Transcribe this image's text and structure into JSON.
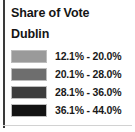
{
  "legend": {
    "title": "Share of Vote",
    "subtitle": "Dublin",
    "classes": [
      {
        "label": "12.1% - 20.0%",
        "color": "#9a9a9a",
        "min": 12.1,
        "max": 20.0
      },
      {
        "label": "20.1% - 28.0%",
        "color": "#6e6e6e",
        "min": 20.1,
        "max": 28.0
      },
      {
        "label": "28.1% - 36.0%",
        "color": "#3d3d3d",
        "min": 28.1,
        "max": 36.0
      },
      {
        "label": "36.1% - 44.0%",
        "color": "#141414",
        "min": 36.1,
        "max": 44.0
      }
    ]
  },
  "chart_data": {
    "type": "table",
    "title": "Share of Vote",
    "subtitle": "Dublin",
    "xlabel": "",
    "ylabel": "",
    "categories": [
      "12.1% - 20.0%",
      "20.1% - 28.0%",
      "28.1% - 36.0%",
      "36.1% - 44.0%"
    ],
    "values": [
      [
        12.1,
        20.0
      ],
      [
        20.1,
        28.0
      ],
      [
        28.1,
        36.0
      ],
      [
        36.1,
        44.0
      ]
    ],
    "series": [
      {
        "name": "Share of Vote class breaks",
        "values": [
          {
            "label": "12.1% - 20.0%",
            "low": 12.1,
            "high": 20.0,
            "color": "#9a9a9a"
          },
          {
            "label": "20.1% - 28.0%",
            "low": 20.1,
            "high": 28.0,
            "color": "#6e6e6e"
          },
          {
            "label": "28.1% - 36.0%",
            "low": 28.1,
            "high": 36.0,
            "color": "#3d3d3d"
          },
          {
            "label": "36.1% - 44.0%",
            "low": 36.1,
            "high": 44.0,
            "color": "#141414"
          }
        ]
      }
    ],
    "legend_position": "panel",
    "grid": false,
    "colormap": "grayscale-sequential",
    "unit": "%",
    "range": [
      12.1,
      44.0
    ]
  }
}
